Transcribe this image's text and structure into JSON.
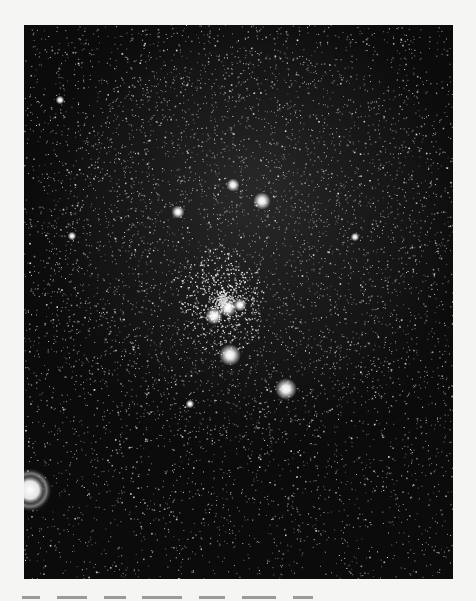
{
  "page": {
    "background": "#f5f5f3"
  },
  "photo": {
    "subject": "star field photograph with milky way haze and central star cluster",
    "sky_color": "#0b0b0b",
    "haze_color": "#5a5a5a",
    "star_color": "#ffffff",
    "bright_stars": [
      {
        "x": 262,
        "y": 201,
        "r": 4
      },
      {
        "x": 286,
        "y": 389,
        "r": 5
      },
      {
        "x": 178,
        "y": 212,
        "r": 3
      },
      {
        "x": 233,
        "y": 185,
        "r": 3
      },
      {
        "x": 230,
        "y": 355,
        "r": 5
      },
      {
        "x": 214,
        "y": 316,
        "r": 4
      },
      {
        "x": 228,
        "y": 308,
        "r": 4
      },
      {
        "x": 240,
        "y": 305,
        "r": 3
      },
      {
        "x": 190,
        "y": 404,
        "r": 2
      },
      {
        "x": 355,
        "y": 237,
        "r": 2
      },
      {
        "x": 72,
        "y": 236,
        "r": 2
      },
      {
        "x": 60,
        "y": 100,
        "r": 2
      }
    ],
    "halo_object": {
      "x": 30,
      "y": 490,
      "r": 14
    }
  },
  "caption": {
    "text": "Fig. — (caption cropped at page edge)"
  }
}
